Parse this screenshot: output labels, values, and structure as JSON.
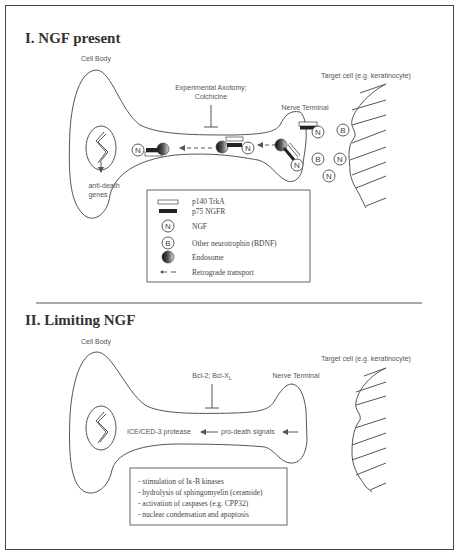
{
  "section1": {
    "title": "I.  NGF present",
    "cell_body_label": "Cell Body",
    "inhibitor_label_line1": "Experimental Axotomy;",
    "inhibitor_label_line2": "Colchicine",
    "nerve_terminal_label": "Nerve Terminal",
    "target_cell_label": "Target cell (e.g. keratinocyte)",
    "nucleus_output_line1": "anti-death",
    "nucleus_output_line2": "genes",
    "circle_N": "N",
    "circle_B": "B"
  },
  "legend": {
    "items": [
      {
        "icon": "open-bar-icon",
        "label": "p140 TrkA"
      },
      {
        "icon": "filled-bar-icon",
        "label": "p75 NGFR"
      },
      {
        "icon": "circle-n-icon",
        "symbol": "N",
        "label": "NGF"
      },
      {
        "icon": "circle-b-icon",
        "symbol": "B",
        "label": "Other neurotrophin (BDNF)"
      },
      {
        "icon": "endosome-icon",
        "label": "Endosome"
      },
      {
        "icon": "dashed-arrow-icon",
        "label": "Retrograde transport"
      }
    ]
  },
  "section2": {
    "title": "II. Limiting NGF",
    "cell_body_label": "Cell Body",
    "inhibitor_label": "Bcl-2; Bcl-X",
    "inhibitor_subscript": "L",
    "nerve_terminal_label": "Nerve Terminal",
    "target_cell_label": "Target cell (e.g. keratinocyte)",
    "protease_label": "ICE/CED-3 protease",
    "signals_label": "pro-death signals",
    "circle_B": "B",
    "events": [
      "- stimulation of Iκ-B kinases",
      "- hydrolysis of sphingomyelin (ceramide)",
      "- activation of caspases (e.g. CPP32)",
      "- nuclear condensation and apoptosis"
    ]
  },
  "colors": {
    "line": "#555555",
    "receptor_fill": "#222222",
    "frame": "#444444"
  }
}
